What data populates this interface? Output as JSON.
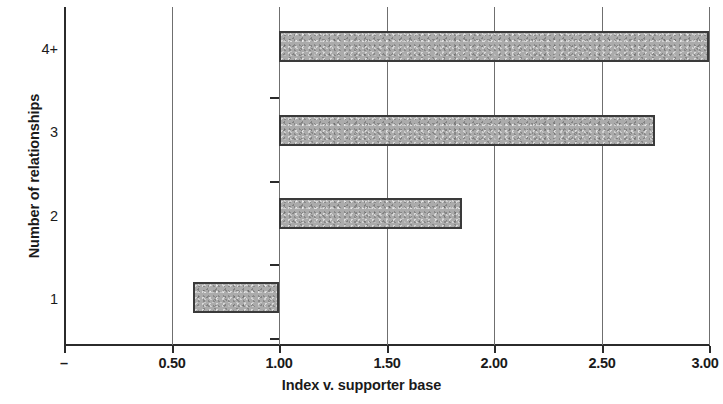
{
  "chart_data": {
    "type": "bar",
    "orientation": "horizontal",
    "title": "",
    "xlabel": "Index v. supporter base",
    "ylabel": "Number of relationships",
    "categories": [
      "1",
      "2",
      "3",
      "4+"
    ],
    "values": [
      0.6,
      1.85,
      2.75,
      3.0
    ],
    "baseline": 1.0,
    "xlim": [
      0,
      3.0
    ],
    "xticks": [
      0,
      0.5,
      1.0,
      1.5,
      2.0,
      2.5,
      3.0
    ],
    "xticklabels": [
      "–",
      "0.50",
      "1.00",
      "1.50",
      "2.00",
      "2.50",
      "3.00"
    ],
    "gridlines_at": [
      0.5,
      1.0,
      1.5,
      2.0,
      2.5,
      3.0
    ],
    "grid": true,
    "legend": null,
    "bar_fill_color": "#ababab",
    "bar_border_color": "#3a3a3a",
    "axis_color": "#2b2b2b",
    "series": [
      {
        "name": "Index v. supporter base",
        "points": [
          {
            "category": "4+",
            "value": 3.0
          },
          {
            "category": "3",
            "value": 2.75
          },
          {
            "category": "2",
            "value": 1.85
          },
          {
            "category": "1",
            "value": 0.6
          }
        ]
      }
    ]
  },
  "axes": {
    "x_title": "Index v. supporter base",
    "y_title": "Number of relationships",
    "x_tick_labels": [
      "–",
      "0.50",
      "1.00",
      "1.50",
      "2.00",
      "2.50",
      "3.00"
    ],
    "y_tick_labels": [
      "4+",
      "3",
      "2",
      "1"
    ]
  }
}
